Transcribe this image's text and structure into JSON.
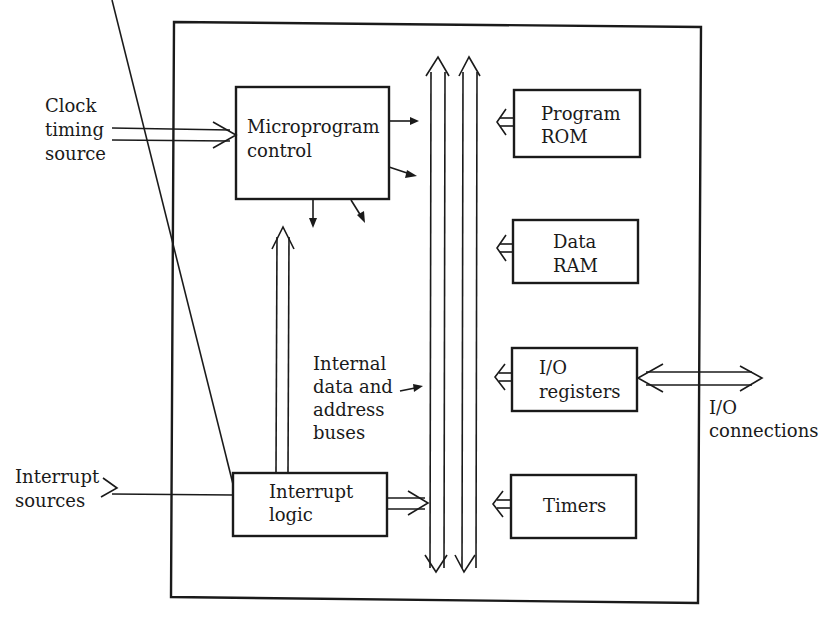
{
  "diagram": {
    "type": "block-diagram",
    "colors": {
      "ink": "#1a1a1a",
      "background": "#ffffff"
    },
    "blocks": {
      "microprogram": {
        "line1": "Microprogram",
        "line2": "control"
      },
      "program_rom": {
        "line1": "Program",
        "line2": "ROM"
      },
      "data_ram": {
        "line1": "Data",
        "line2": "RAM"
      },
      "io_registers": {
        "line1": "I/O",
        "line2": "registers"
      },
      "timers": {
        "line1": "Timers"
      },
      "interrupt_logic": {
        "line1": "Interrupt",
        "line2": "logic"
      }
    },
    "external_labels": {
      "clock": {
        "line1": "Clock",
        "line2": "timing",
        "line3": "source"
      },
      "interrupt_sources": {
        "line1": "Interrupt",
        "line2": "sources"
      },
      "io_connections": {
        "line1": "I/O",
        "line2": "connections"
      }
    },
    "bus_label": {
      "line1": "Internal",
      "line2": "data and",
      "line3": "address",
      "line4": "buses"
    },
    "connections": [
      {
        "from": "Clock timing source",
        "to": "Microprogram control",
        "style": "double-line arrow"
      },
      {
        "from": "Microprogram control",
        "to": "control outputs",
        "style": "4 single arrows"
      },
      {
        "from": "Interrupt sources",
        "to": "Interrupt logic",
        "style": "double-line"
      },
      {
        "from": "Interrupt logic",
        "to": "Microprogram control",
        "style": "double-line arrow up"
      },
      {
        "from": "Interrupt logic",
        "to": "Internal buses",
        "style": "double-line arrow"
      },
      {
        "from": "Internal buses",
        "to": "Program ROM",
        "style": "bus connection"
      },
      {
        "from": "Internal buses",
        "to": "Data RAM",
        "style": "bus connection"
      },
      {
        "from": "Internal buses",
        "to": "I/O registers",
        "style": "bus connection"
      },
      {
        "from": "Internal buses",
        "to": "Timers",
        "style": "bus connection"
      },
      {
        "from": "I/O registers",
        "to": "I/O connections",
        "style": "bidirectional double-line arrow"
      }
    ]
  }
}
